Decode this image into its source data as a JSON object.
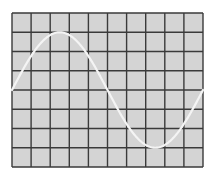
{
  "chart_data": {
    "type": "line",
    "title": "",
    "xlabel": "",
    "ylabel": "",
    "grid": true,
    "divisions": {
      "x": 10,
      "y": 8
    },
    "xlim": [
      0,
      10
    ],
    "ylim": [
      -4,
      4
    ],
    "series": [
      {
        "name": "sine-trace",
        "function": "sin",
        "amplitude_div": 3,
        "period_div": 10,
        "phase": 0,
        "x": [
          0,
          1,
          2,
          2.5,
          3,
          4,
          5,
          6,
          7,
          7.5,
          8,
          9,
          10
        ],
        "values": [
          0,
          1.76,
          2.85,
          3.0,
          2.85,
          1.76,
          0,
          -1.76,
          -2.85,
          -3.0,
          -2.85,
          -1.76,
          0
        ]
      }
    ],
    "legend": null
  },
  "colors": {
    "background": "#ffffff",
    "screen": "#d4d4d4",
    "grid": "#3a3a3a",
    "trace": "#f4f4f4"
  },
  "geometry": {
    "left": 12,
    "top": 13,
    "right": 203,
    "bottom": 167
  }
}
